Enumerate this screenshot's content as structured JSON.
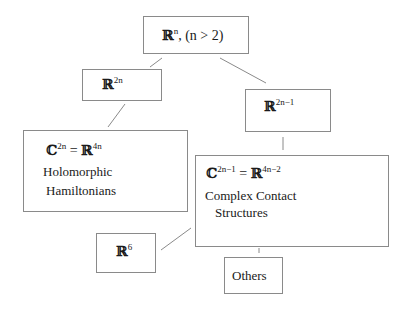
{
  "nodes": {
    "root": {
      "base": "ℝ",
      "sup": "n",
      "suffix": ", (n > 2)"
    },
    "r2n": {
      "base": "ℝ",
      "sup": "2n"
    },
    "r2n1": {
      "base": "ℝ",
      "sup": "2n−1"
    },
    "holo": {
      "base1": "ℂ",
      "sup1": "2n",
      "eq": " = ",
      "base2": "ℝ",
      "sup2": "4n",
      "line1": "Holomorphic",
      "line2": "Hamiltonians"
    },
    "contact": {
      "base1": "ℂ",
      "sup1": "2n−1",
      "eq": " = ",
      "base2": "ℝ",
      "sup2": "4n−2",
      "line1": "Complex Contact",
      "line2": "Structures"
    },
    "r6": {
      "base": "ℝ",
      "sup": "6"
    },
    "others": {
      "label": "Others"
    }
  },
  "colors": {
    "border": "#8a8a8a",
    "edge": "#8a8a8a",
    "text": "#1a1a1a"
  }
}
